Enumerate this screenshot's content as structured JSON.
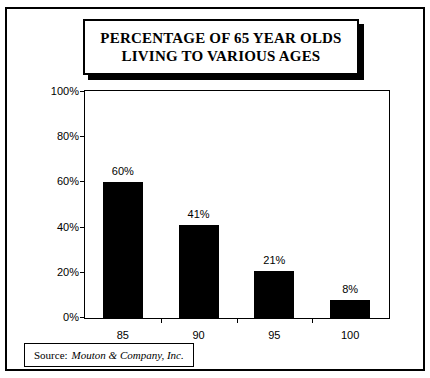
{
  "figure": {
    "title": "PERCENTAGE OF 65 YEAR OLDS\nLIVING TO VARIOUS AGES",
    "source_prefix": "Source:",
    "source_name": "Mouton & Company, Inc.",
    "border_color": "#000000",
    "background_color": "#ffffff",
    "bar_color": "#000000"
  },
  "chart_data": {
    "type": "bar",
    "title": "PERCENTAGE OF 65 YEAR OLDS LIVING TO VARIOUS AGES",
    "categories": [
      "85",
      "90",
      "95",
      "100"
    ],
    "values": [
      60,
      41,
      21,
      8
    ],
    "data_labels": [
      "60%",
      "41%",
      "21%",
      "8%"
    ],
    "xlabel": "",
    "ylabel": "",
    "ylim": [
      0,
      100
    ],
    "yticks": [
      0,
      20,
      40,
      60,
      80,
      100
    ],
    "ytick_labels": [
      "0%",
      "20%",
      "40%",
      "60%",
      "80%",
      "100%"
    ],
    "grid": false,
    "legend": false,
    "series": [
      {
        "name": "Percentage living to age",
        "values": [
          60,
          41,
          21,
          8
        ]
      }
    ]
  }
}
